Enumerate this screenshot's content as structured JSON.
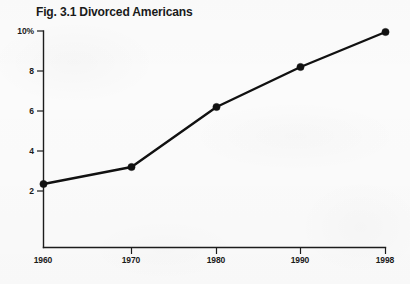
{
  "figure": {
    "title": "Fig. 3.1 Divorced Americans",
    "background_color": "#fbfbfb",
    "ink_color": "#111111"
  },
  "chart_data": {
    "type": "line",
    "title": "Fig. 3.1 Divorced Americans",
    "xlabel": "",
    "ylabel": "",
    "x": [
      1960,
      1970,
      1980,
      1990,
      1998
    ],
    "categories": [
      "1960",
      "1970",
      "1980",
      "1990",
      "1998"
    ],
    "values": [
      2.35,
      3.2,
      6.2,
      8.2,
      9.95
    ],
    "series": [
      {
        "name": "Divorced Americans",
        "values": [
          2.35,
          3.2,
          6.2,
          8.2,
          9.95
        ]
      }
    ],
    "x_tick_labels": [
      "1960",
      "1970",
      "1980",
      "1990",
      "1998"
    ],
    "y_tick_labels": [
      "2",
      "4",
      "6",
      "8",
      "10%"
    ],
    "y_tick_values": [
      2,
      4,
      6,
      8,
      10
    ],
    "ylim": [
      0,
      10
    ],
    "xlim": [
      1960,
      1998
    ],
    "grid": false,
    "legend": false,
    "marker": "filled-circle",
    "line_color": "#111111",
    "units": "percent"
  },
  "axis": {
    "y_labels": [
      {
        "text": "10%",
        "value": 10
      },
      {
        "text": "8",
        "value": 8
      },
      {
        "text": "6",
        "value": 6
      },
      {
        "text": "4",
        "value": 4
      },
      {
        "text": "2",
        "value": 2
      }
    ],
    "x_labels": [
      {
        "text": "1960",
        "value": 1960
      },
      {
        "text": "1970",
        "value": 1970
      },
      {
        "text": "1980",
        "value": 1980
      },
      {
        "text": "1990",
        "value": 1990
      },
      {
        "text": "1998",
        "value": 1998
      }
    ]
  }
}
